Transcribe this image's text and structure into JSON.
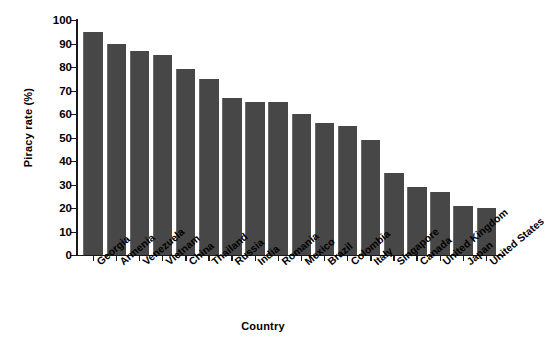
{
  "chart_data": {
    "type": "bar",
    "title": "",
    "xlabel": "Country",
    "ylabel": "Piracy rate (%)",
    "ylim": [
      0,
      100
    ],
    "yticks": [
      0,
      10,
      20,
      30,
      40,
      50,
      60,
      70,
      80,
      90,
      100
    ],
    "grid": false,
    "legend": null,
    "bar_color": "#474747",
    "axis_color": "#1a1a1a",
    "background": "#ffffff",
    "categories": [
      "Georgia",
      "Armenia",
      "Venezuela",
      "Vietnam",
      "China",
      "Thailand",
      "Russia",
      "India",
      "Romania",
      "Mexico",
      "Brazil",
      "Colombia",
      "Italy",
      "Singapore",
      "Canada",
      "United Kingdom",
      "Japan",
      "United States"
    ],
    "values": [
      95,
      90,
      87,
      85,
      79,
      75,
      67,
      65,
      65,
      60,
      56,
      55,
      49,
      35,
      29,
      27,
      21,
      20
    ]
  }
}
